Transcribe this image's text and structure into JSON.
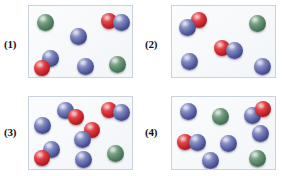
{
  "figure": {
    "type": "molecular-diagram",
    "panel_count": 4,
    "legend_colors": {
      "blue_atom": "#4f579c",
      "red_atom": "#c41f26",
      "green_atom": "#4d7a5c"
    },
    "box_border_color": "#c9d2dd",
    "box_fill_color": "#f7f9fb"
  },
  "panels": [
    {
      "label": "(1)",
      "counts": {
        "blue": 5,
        "red": 2,
        "green": 2
      },
      "particles": [
        {
          "kind": "atom",
          "color": "green",
          "x": 16,
          "y": 16,
          "r": 8.5
        },
        {
          "kind": "atom",
          "color": "blue",
          "x": 49,
          "y": 30,
          "r": 8.5
        },
        {
          "kind": "molecule",
          "atoms": [
            {
              "color": "red",
              "x": 80,
              "y": 15,
              "r": 8
            },
            {
              "color": "blue",
              "x": 92,
              "y": 16,
              "r": 8.5
            }
          ]
        },
        {
          "kind": "molecule",
          "atoms": [
            {
              "color": "blue",
              "x": 21,
              "y": 52,
              "r": 8.5
            },
            {
              "color": "red",
              "x": 13,
              "y": 62,
              "r": 8
            }
          ]
        },
        {
          "kind": "atom",
          "color": "blue",
          "x": 56,
          "y": 60,
          "r": 8.5
        },
        {
          "kind": "atom",
          "color": "green",
          "x": 88,
          "y": 58,
          "r": 8.5
        }
      ]
    },
    {
      "label": "(2)",
      "counts": {
        "blue": 4,
        "red": 2,
        "green": 1
      },
      "particles": [
        {
          "kind": "molecule",
          "atoms": [
            {
              "color": "red",
              "x": 27,
              "y": 14,
              "r": 8
            },
            {
              "color": "blue",
              "x": 15,
              "y": 21,
              "r": 8.5
            }
          ]
        },
        {
          "kind": "atom",
          "color": "green",
          "x": 85,
          "y": 17,
          "r": 8.5
        },
        {
          "kind": "molecule",
          "atoms": [
            {
              "color": "red",
              "x": 50,
              "y": 42,
              "r": 8
            },
            {
              "color": "blue",
              "x": 62,
              "y": 44,
              "r": 8.5
            }
          ]
        },
        {
          "kind": "atom",
          "color": "blue",
          "x": 17,
          "y": 55,
          "r": 8.5
        },
        {
          "kind": "atom",
          "color": "blue",
          "x": 90,
          "y": 60,
          "r": 8.5
        }
      ]
    },
    {
      "label": "(3)",
      "counts": {
        "blue": 7,
        "red": 4,
        "green": 1
      },
      "particles": [
        {
          "kind": "molecule",
          "atoms": [
            {
              "color": "blue",
              "x": 36,
              "y": 13,
              "r": 8.5
            },
            {
              "color": "red",
              "x": 47,
              "y": 20,
              "r": 8
            }
          ]
        },
        {
          "kind": "molecule",
          "atoms": [
            {
              "color": "red",
              "x": 80,
              "y": 13,
              "r": 8
            },
            {
              "color": "blue",
              "x": 92,
              "y": 15,
              "r": 8.5
            }
          ]
        },
        {
          "kind": "atom",
          "color": "blue",
          "x": 13,
          "y": 28,
          "r": 8.5
        },
        {
          "kind": "molecule",
          "atoms": [
            {
              "color": "red",
              "x": 63,
              "y": 33,
              "r": 8
            },
            {
              "color": "blue",
              "x": 53,
              "y": 42,
              "r": 8.5
            }
          ]
        },
        {
          "kind": "molecule",
          "atoms": [
            {
              "color": "blue",
              "x": 22,
              "y": 52,
              "r": 8.5
            },
            {
              "color": "red",
              "x": 13,
              "y": 61,
              "r": 8
            }
          ]
        },
        {
          "kind": "atom",
          "color": "blue",
          "x": 54,
          "y": 62,
          "r": 8.5
        },
        {
          "kind": "atom",
          "color": "green",
          "x": 86,
          "y": 56,
          "r": 8.5
        }
      ]
    },
    {
      "label": "(4)",
      "counts": {
        "blue": 7,
        "red": 2,
        "green": 2
      },
      "particles": [
        {
          "kind": "atom",
          "color": "blue",
          "x": 16,
          "y": 14,
          "r": 8.5
        },
        {
          "kind": "atom",
          "color": "green",
          "x": 48,
          "y": 19,
          "r": 8.5
        },
        {
          "kind": "molecule",
          "atoms": [
            {
              "color": "blue",
              "x": 80,
              "y": 18,
              "r": 8.5
            },
            {
              "color": "red",
              "x": 91,
              "y": 12,
              "r": 8
            }
          ]
        },
        {
          "kind": "atom",
          "color": "blue",
          "x": 88,
          "y": 36,
          "r": 8.5
        },
        {
          "kind": "molecule",
          "atoms": [
            {
              "color": "red",
              "x": 13,
              "y": 45,
              "r": 8
            },
            {
              "color": "blue",
              "x": 25,
              "y": 45,
              "r": 8.5
            }
          ]
        },
        {
          "kind": "atom",
          "color": "blue",
          "x": 56,
          "y": 46,
          "r": 8.5
        },
        {
          "kind": "atom",
          "color": "blue",
          "x": 38,
          "y": 63,
          "r": 8.5
        },
        {
          "kind": "atom",
          "color": "green",
          "x": 85,
          "y": 61,
          "r": 8.5
        }
      ]
    }
  ]
}
